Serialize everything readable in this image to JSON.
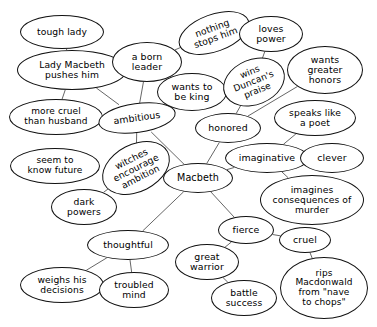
{
  "diagram": {
    "type": "concept-map",
    "subject": "Macbeth",
    "background_color": "#ffffff",
    "node_fill": "#ffffff",
    "node_stroke": "#111111",
    "edge_stroke": "#555555",
    "text_color": "#000000",
    "width": 377,
    "height": 327,
    "nodes": [
      {
        "id": "tough-lady",
        "label": "tough lady",
        "cx": 62,
        "cy": 32,
        "rx": 42,
        "ry": 17,
        "fs": 9.2,
        "rot": 0,
        "bold": false
      },
      {
        "id": "lady-macbeth",
        "label": "Lady Macbeth\npushes him",
        "cx": 72,
        "cy": 70,
        "rx": 55,
        "ry": 20,
        "fs": 9.2,
        "rot": 0,
        "bold": true
      },
      {
        "id": "more-cruel",
        "label": "more cruel\nthan husband",
        "cx": 56,
        "cy": 117,
        "rx": 47,
        "ry": 18,
        "fs": 9.0,
        "rot": 0,
        "bold": false
      },
      {
        "id": "seem-know-future",
        "label": "seem to\nknow future",
        "cx": 55,
        "cy": 166,
        "rx": 45,
        "ry": 18,
        "fs": 9.0,
        "rot": 0,
        "bold": false
      },
      {
        "id": "a-born-leader",
        "label": "a born\nleader",
        "cx": 147,
        "cy": 62,
        "rx": 35,
        "ry": 20,
        "fs": 9.4,
        "rot": 0,
        "bold": false
      },
      {
        "id": "ambitious",
        "label": "ambitious",
        "cx": 137,
        "cy": 118,
        "rx": 39,
        "ry": 15,
        "fs": 9.4,
        "rot": -8,
        "bold": false
      },
      {
        "id": "witches-encourage",
        "label": "witches\nencourage\nambition",
        "cx": 136,
        "cy": 168,
        "rx": 36,
        "ry": 24,
        "fs": 9.2,
        "rot": -27,
        "bold": false
      },
      {
        "id": "dark-powers",
        "label": "dark\npowers",
        "cx": 84,
        "cy": 207,
        "rx": 33,
        "ry": 18,
        "fs": 9.2,
        "rot": 0,
        "bold": false
      },
      {
        "id": "thoughtful",
        "label": "thoughtful",
        "cx": 128,
        "cy": 245,
        "rx": 41,
        "ry": 15,
        "fs": 9.4,
        "rot": 0,
        "bold": false
      },
      {
        "id": "weighs-decisions",
        "label": "weighs his\ndecisions",
        "cx": 62,
        "cy": 285,
        "rx": 42,
        "ry": 18,
        "fs": 9.2,
        "rot": 0,
        "bold": false
      },
      {
        "id": "troubled-mind",
        "label": "troubled\nmind",
        "cx": 134,
        "cy": 290,
        "rx": 35,
        "ry": 18,
        "fs": 9.2,
        "rot": 0,
        "bold": false
      },
      {
        "id": "nothing-stops",
        "label": "nothing\nstops him",
        "cx": 214,
        "cy": 33,
        "rx": 37,
        "ry": 19,
        "fs": 9.2,
        "rot": -20,
        "bold": false
      },
      {
        "id": "wants-to-be-king",
        "label": "wants to\nbe king",
        "cx": 192,
        "cy": 92,
        "rx": 35,
        "ry": 19,
        "fs": 9.4,
        "rot": 0,
        "bold": false
      },
      {
        "id": "wins-duncan",
        "label": "wins\nDuncan's\npraise",
        "cx": 254,
        "cy": 82,
        "rx": 32,
        "ry": 23,
        "fs": 9.0,
        "rot": -22,
        "bold": false
      },
      {
        "id": "loves-power",
        "label": "loves\npower",
        "cx": 271,
        "cy": 34,
        "rx": 32,
        "ry": 18,
        "fs": 9.4,
        "rot": 0,
        "bold": false
      },
      {
        "id": "wants-greater",
        "label": "wants\ngreater\nhonors",
        "cx": 325,
        "cy": 70,
        "rx": 38,
        "ry": 24,
        "fs": 9.4,
        "rot": 0,
        "bold": false
      },
      {
        "id": "honored",
        "label": "honored",
        "cx": 228,
        "cy": 128,
        "rx": 33,
        "ry": 15,
        "fs": 9.4,
        "rot": 0,
        "bold": false
      },
      {
        "id": "speaks-poet",
        "label": "speaks like\na poet",
        "cx": 315,
        "cy": 118,
        "rx": 41,
        "ry": 18,
        "fs": 9.2,
        "rot": 0,
        "bold": false
      },
      {
        "id": "imaginative",
        "label": "imaginative",
        "cx": 267,
        "cy": 158,
        "rx": 42,
        "ry": 15,
        "fs": 9.4,
        "rot": 0,
        "bold": false
      },
      {
        "id": "clever",
        "label": "clever",
        "cx": 332,
        "cy": 158,
        "rx": 32,
        "ry": 15,
        "fs": 9.4,
        "rot": 0,
        "bold": false
      },
      {
        "id": "macbeth",
        "label": "Macbeth",
        "cx": 198,
        "cy": 178,
        "rx": 35,
        "ry": 15,
        "fs": 9.6,
        "rot": 0,
        "bold": false
      },
      {
        "id": "imagines-conseq",
        "label": "imagines\nconsequences of\nmurder",
        "cx": 312,
        "cy": 200,
        "rx": 52,
        "ry": 25,
        "fs": 9.2,
        "rot": 0,
        "bold": false
      },
      {
        "id": "fierce",
        "label": "fierce",
        "cx": 246,
        "cy": 230,
        "rx": 28,
        "ry": 14,
        "fs": 9.4,
        "rot": 0,
        "bold": false
      },
      {
        "id": "cruel",
        "label": "cruel",
        "cx": 305,
        "cy": 240,
        "rx": 26,
        "ry": 13,
        "fs": 9.4,
        "rot": 0,
        "bold": false
      },
      {
        "id": "great-warrior",
        "label": "great\nwarrior",
        "cx": 207,
        "cy": 262,
        "rx": 32,
        "ry": 18,
        "fs": 9.4,
        "rot": 0,
        "bold": false
      },
      {
        "id": "battle-success",
        "label": "battle\nsuccess",
        "cx": 244,
        "cy": 298,
        "rx": 33,
        "ry": 18,
        "fs": 9.2,
        "rot": 0,
        "bold": false
      },
      {
        "id": "rips-macdonwald",
        "label": "rips\nMacdonwald\nfrom \"nave\nto chops\"",
        "cx": 324,
        "cy": 288,
        "rx": 44,
        "ry": 31,
        "fs": 9.0,
        "rot": 0,
        "bold": false
      }
    ],
    "edges": [
      {
        "from": "tough-lady",
        "to": "lady-macbeth"
      },
      {
        "from": "lady-macbeth",
        "to": "more-cruel"
      },
      {
        "from": "lady-macbeth",
        "to": "ambitious"
      },
      {
        "from": "a-born-leader",
        "to": "ambitious"
      },
      {
        "from": "a-born-leader",
        "to": "nothing-stops"
      },
      {
        "from": "nothing-stops",
        "to": "loves-power"
      },
      {
        "from": "loves-power",
        "to": "wins-duncan"
      },
      {
        "from": "wants-to-be-king",
        "to": "ambitious"
      },
      {
        "from": "wants-to-be-king",
        "to": "wins-duncan"
      },
      {
        "from": "wins-duncan",
        "to": "honored"
      },
      {
        "from": "wants-greater",
        "to": "honored"
      },
      {
        "from": "honored",
        "to": "macbeth"
      },
      {
        "from": "ambitious",
        "to": "macbeth"
      },
      {
        "from": "ambitious",
        "to": "witches-encourage"
      },
      {
        "from": "seem-know-future",
        "to": "witches-encourage"
      },
      {
        "from": "witches-encourage",
        "to": "dark-powers"
      },
      {
        "from": "witches-encourage",
        "to": "macbeth"
      },
      {
        "from": "macbeth",
        "to": "thoughtful"
      },
      {
        "from": "thoughtful",
        "to": "weighs-decisions"
      },
      {
        "from": "thoughtful",
        "to": "troubled-mind"
      },
      {
        "from": "macbeth",
        "to": "imaginative"
      },
      {
        "from": "imaginative",
        "to": "clever"
      },
      {
        "from": "imaginative",
        "to": "speaks-poet"
      },
      {
        "from": "imaginative",
        "to": "imagines-conseq"
      },
      {
        "from": "macbeth",
        "to": "fierce"
      },
      {
        "from": "fierce",
        "to": "great-warrior"
      },
      {
        "from": "fierce",
        "to": "cruel"
      },
      {
        "from": "great-warrior",
        "to": "battle-success"
      },
      {
        "from": "cruel",
        "to": "rips-macdonwald"
      }
    ]
  }
}
